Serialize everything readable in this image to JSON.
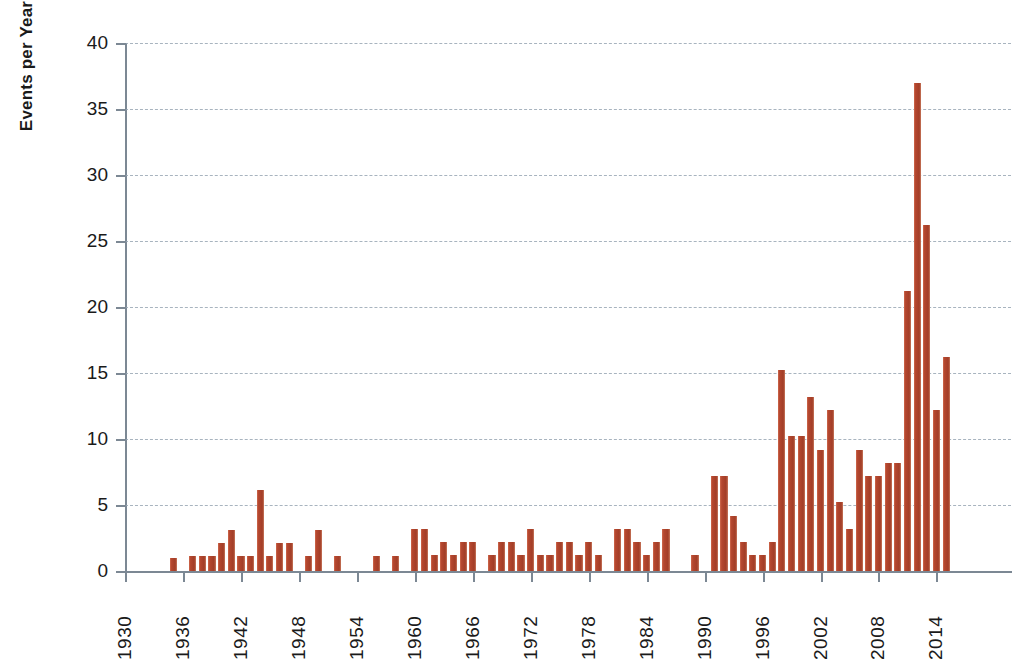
{
  "chart_data": {
    "type": "bar",
    "title": "",
    "xlabel": "",
    "ylabel": "Events per Year",
    "ylim": [
      0,
      40
    ],
    "yticks": [
      0,
      5,
      10,
      15,
      20,
      25,
      30,
      35,
      40
    ],
    "xlim": [
      1929.5,
      1917.5
    ],
    "xticks": [
      1930,
      1936,
      1942,
      1948,
      1954,
      1960,
      1966,
      1972,
      1978,
      1984,
      1990,
      1996,
      2002,
      2008,
      2014
    ],
    "grid": "horizontal-dashed",
    "legend": "none",
    "bar_color": "#b4472f",
    "categories": [
      1930,
      1931,
      1932,
      1933,
      1934,
      1935,
      1936,
      1937,
      1938,
      1939,
      1940,
      1941,
      1942,
      1943,
      1944,
      1945,
      1946,
      1947,
      1948,
      1949,
      1950,
      1951,
      1952,
      1953,
      1954,
      1955,
      1956,
      1957,
      1958,
      1959,
      1960,
      1961,
      1962,
      1963,
      1964,
      1965,
      1966,
      1967,
      1968,
      1969,
      1970,
      1971,
      1972,
      1973,
      1974,
      1975,
      1976,
      1977,
      1978,
      1979,
      1980,
      1981,
      1982,
      1983,
      1984,
      1985,
      1986,
      1987,
      1988,
      1989,
      1990,
      1991,
      1992,
      1993,
      1994,
      1995,
      1996,
      1997,
      1998,
      1999,
      2000,
      2001,
      2002,
      2003,
      2004,
      2005,
      2006,
      2007,
      2008,
      2009,
      2010,
      2011,
      2012,
      2013,
      2014,
      2015,
      2016
    ],
    "values": [
      0,
      0,
      0,
      0,
      0,
      1,
      0,
      1,
      1,
      1,
      2,
      3,
      1,
      1,
      6,
      1,
      2,
      2,
      0,
      1,
      3,
      0,
      1,
      0,
      0,
      0,
      1,
      0,
      1,
      0,
      3,
      3,
      1,
      2,
      1,
      2,
      2,
      0,
      1,
      2,
      2,
      1,
      3,
      1,
      1,
      2,
      2,
      1,
      2,
      1,
      0,
      3,
      3,
      2,
      1,
      2,
      3,
      0,
      0,
      1,
      0,
      7,
      7,
      4,
      2,
      1,
      1,
      2,
      15,
      10,
      10,
      13,
      9,
      12,
      5,
      3,
      9,
      7,
      7,
      8,
      8,
      21,
      37,
      26,
      12,
      16,
      0
    ],
    "values_precise": [
      0,
      0,
      0,
      0,
      0,
      1.0,
      0,
      1.1,
      1.1,
      1.1,
      2.1,
      3.1,
      1.1,
      1.1,
      6.1,
      1.1,
      2.1,
      2.1,
      0,
      1.1,
      3.1,
      0,
      1.1,
      0,
      0,
      0,
      1.1,
      0,
      1.1,
      0,
      3.2,
      3.2,
      1.2,
      2.2,
      1.2,
      2.2,
      2.2,
      0,
      1.2,
      2.2,
      2.2,
      1.2,
      3.2,
      1.2,
      1.2,
      2.2,
      2.2,
      1.2,
      2.2,
      1.2,
      0,
      3.2,
      3.2,
      2.2,
      1.2,
      2.2,
      3.2,
      0,
      0,
      1.2,
      0,
      7.2,
      7.2,
      4.2,
      2.2,
      1.2,
      1.2,
      2.2,
      15.2,
      10.2,
      10.2,
      13.2,
      9.2,
      12.2,
      5.2,
      3.2,
      9.2,
      7.2,
      7.2,
      8.2,
      8.2,
      21.2,
      37.0,
      26.2,
      12.2,
      16.2,
      0
    ]
  }
}
